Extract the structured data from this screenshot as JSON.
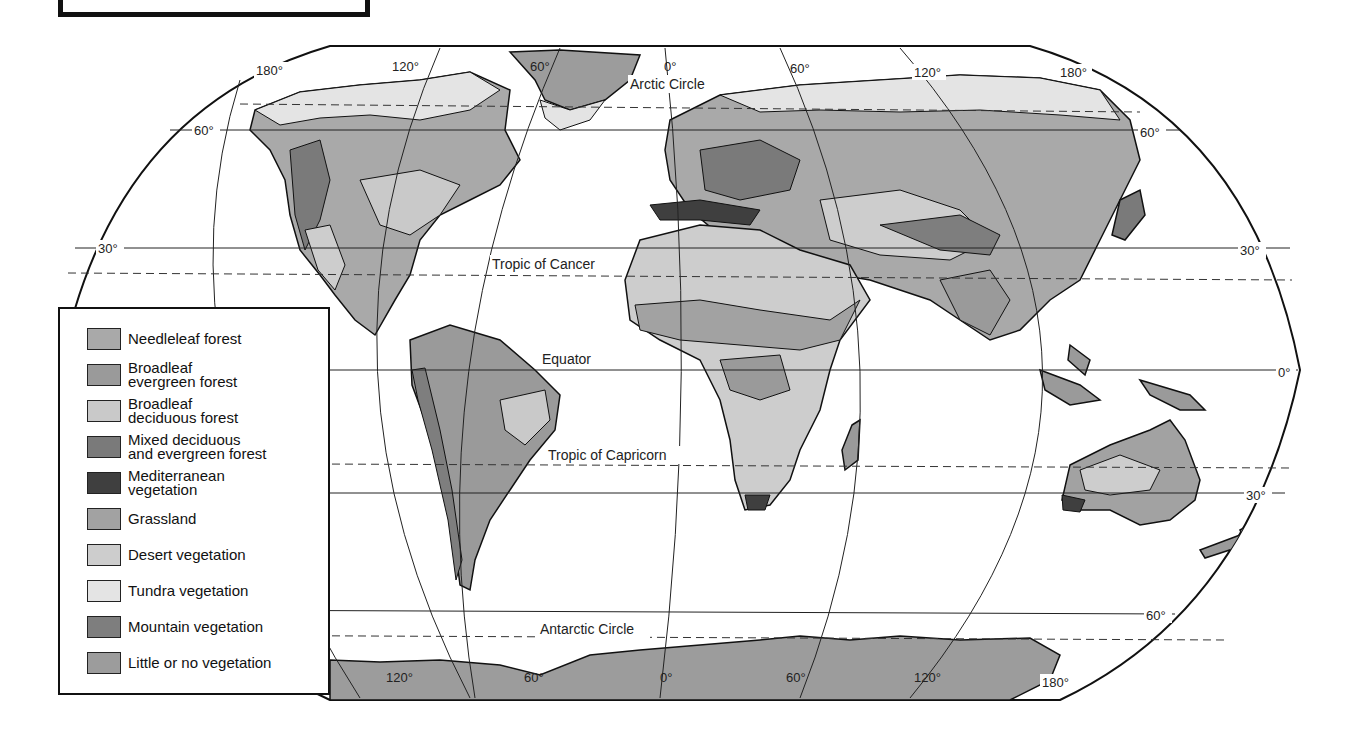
{
  "map": {
    "type": "world vegetation map",
    "projection": "Robinson-like",
    "reference_lines": {
      "arctic_circle": "Arctic Circle",
      "tropic_of_cancer": "Tropic of Cancer",
      "equator": "Equator",
      "tropic_of_capricorn": "Tropic of Capricorn",
      "antarctic_circle": "Antarctic Circle"
    },
    "latitude_labels": {
      "left_60n": "60°",
      "left_30n": "30°",
      "right_60n": "60°",
      "right_30n": "30°",
      "right_0": "0°",
      "right_30s": "30°",
      "right_60s": "60°"
    },
    "longitude_labels_top": [
      "180°",
      "120°",
      "60°",
      "0°",
      "60°",
      "120°",
      "180°"
    ],
    "longitude_labels_bottom": [
      "120°",
      "60°",
      "0°",
      "60°",
      "120°",
      "180°"
    ]
  },
  "legend": {
    "items": [
      {
        "lines": [
          "Needleleaf forest"
        ],
        "color": "#a9a9a9"
      },
      {
        "lines": [
          "Broadleaf",
          "evergreen forest"
        ],
        "color": "#9a9a9a"
      },
      {
        "lines": [
          "Broadleaf",
          "deciduous forest"
        ],
        "color": "#c9c9c9"
      },
      {
        "lines": [
          "Mixed deciduous",
          "and evergreen forest"
        ],
        "color": "#7a7a7a"
      },
      {
        "lines": [
          "Mediterranean",
          "vegetation"
        ],
        "color": "#3f3f3f"
      },
      {
        "lines": [
          "Grassland"
        ],
        "color": "#a2a2a2"
      },
      {
        "lines": [
          "Desert vegetation"
        ],
        "color": "#cdcdcd"
      },
      {
        "lines": [
          "Tundra vegetation"
        ],
        "color": "#e4e4e4"
      },
      {
        "lines": [
          "Mountain vegetation"
        ],
        "color": "#7e7e7e"
      },
      {
        "lines": [
          "Little or no vegetation"
        ],
        "color": "#9c9c9c"
      }
    ]
  }
}
